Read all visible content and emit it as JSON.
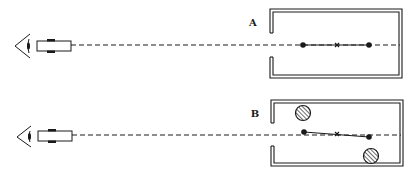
{
  "diagram": {
    "colors": {
      "ink": "#1a1a1a",
      "background": "#ffffff"
    },
    "panels": [
      {
        "id": "A",
        "label": "A",
        "label_pos": [
          253,
          26
        ],
        "axis_y": 45,
        "eye": {
          "apex": [
            15,
            46
          ],
          "top": [
            30,
            34
          ],
          "bottom": [
            30,
            58
          ]
        },
        "eyepiece": {
          "x": 37,
          "y": 41,
          "w": 34,
          "h": 10
        },
        "box": {
          "left": 270,
          "top": 9,
          "right": 402,
          "bottom": 78,
          "gap_top": 33,
          "gap_bottom": 57
        },
        "dot_left": [
          303,
          45
        ],
        "center_mark": [
          337,
          45
        ],
        "dot_right": [
          369,
          45
        ],
        "hatched_circles": []
      },
      {
        "id": "B",
        "label": "B",
        "label_pos": [
          255,
          117
        ],
        "axis_y": 135,
        "eye": {
          "apex": [
            17,
            137
          ],
          "top": [
            31,
            126
          ],
          "bottom": [
            31,
            147
          ]
        },
        "eyepiece": {
          "x": 38,
          "y": 131,
          "w": 34,
          "h": 10
        },
        "box": {
          "left": 271,
          "top": 100,
          "right": 403,
          "bottom": 166,
          "gap_top": 123,
          "gap_bottom": 146
        },
        "dot_left": [
          304,
          132
        ],
        "center_mark": [
          337,
          134
        ],
        "dot_right": [
          369,
          137
        ],
        "hatched_circles": [
          {
            "cx": 303,
            "cy": 113,
            "r": 7.5
          },
          {
            "cx": 371,
            "cy": 156,
            "r": 7.5
          }
        ]
      }
    ]
  }
}
